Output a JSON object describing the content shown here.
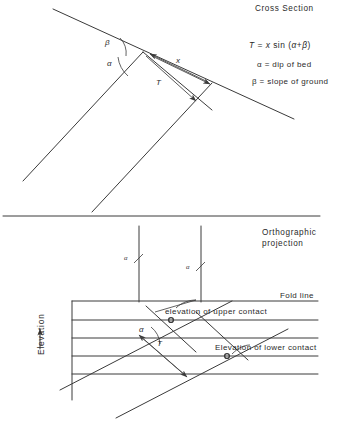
{
  "figure": {
    "type": "technical-diagram"
  },
  "cross_section": {
    "title": "Cross Section",
    "formula": {
      "lhs": "T",
      "equals": "=",
      "var_x": "x",
      "func": "sin",
      "args": "(α+β)",
      "full": "T = x  sin  (α+β)"
    },
    "definitions": [
      {
        "symbol": "α",
        "equals": "=",
        "text": "dip of bed",
        "full": "α = dip of bed"
      },
      {
        "symbol": "β",
        "equals": "=",
        "text": "slope of ground",
        "full": "β = slope of ground"
      }
    ],
    "angle_labels": {
      "beta": "β",
      "alpha": "α"
    },
    "measure_labels": {
      "x": "x",
      "thickness": "T"
    }
  },
  "orthographic": {
    "title_line1": "Orthographic",
    "title_line2": "projection",
    "fold_line_label": "Fold line",
    "axis_label": "Elevation",
    "alpha_marks": [
      {
        "symbol": "α"
      },
      {
        "symbol": "α"
      }
    ],
    "annotations": [
      {
        "text": "elevation of upper contact"
      },
      {
        "text": "Elevation of lower contact"
      }
    ],
    "angle_label": "α",
    "thickness_label": "T"
  },
  "colors": {
    "ink": "#3a3a3a",
    "text": "#2a2a2a",
    "background": "#ffffff"
  }
}
